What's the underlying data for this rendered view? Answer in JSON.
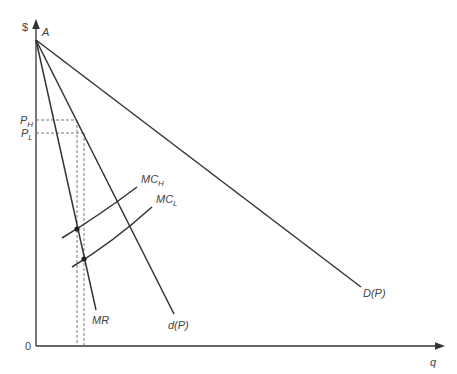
{
  "diagram": {
    "axes": {
      "y_label": "$",
      "x_label": "q",
      "origin_label": "0"
    },
    "points": {
      "apex_label": "A"
    },
    "price_labels": {
      "high": {
        "main": "P",
        "sub": "H"
      },
      "low": {
        "main": "P",
        "sub": "L"
      }
    },
    "curves": {
      "mr": "MR",
      "d": "d(P)",
      "D": "D(P)",
      "mc_high": {
        "main": "MC",
        "sub": "H"
      },
      "mc_low": {
        "main": "MC",
        "sub": "L"
      }
    },
    "colors": {
      "line": "#333333",
      "text": "#444444",
      "dash": "#777777"
    }
  }
}
